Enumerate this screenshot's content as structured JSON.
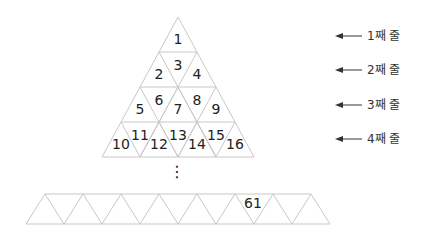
{
  "diagram": {
    "type": "triangular-number-pyramid",
    "pyramid": {
      "rows": [
        {
          "row": 1,
          "numbers": [
            1
          ]
        },
        {
          "row": 2,
          "numbers": [
            2,
            3,
            4
          ]
        },
        {
          "row": 3,
          "numbers": [
            5,
            6,
            7,
            8,
            9
          ]
        },
        {
          "row": 4,
          "numbers": [
            10,
            11,
            12,
            13,
            14,
            15,
            16
          ]
        }
      ]
    },
    "continuation": "⋮",
    "bottom_row": {
      "shown_number": "61",
      "position_index": 12
    },
    "row_labels": [
      "1째 줄",
      "2째 줄",
      "3째 줄",
      "4째 줄"
    ],
    "colors": {
      "line": "#c8c8c8",
      "text": "#222222",
      "arrow": "#333333"
    }
  }
}
